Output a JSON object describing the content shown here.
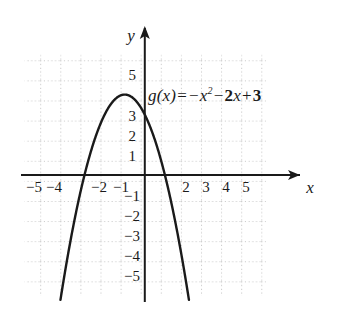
{
  "figure": {
    "background_color": "#ffffff",
    "ink_color": "#1a1a1a",
    "grid_color": "#c8c8c8"
  },
  "equation": {
    "function_name": "g(x)",
    "equals": "=",
    "term1_sign": "−",
    "term1_base": "x",
    "term1_exponent": "2",
    "term2_sign": "−",
    "term2_coefficient": "2",
    "term2_variable": "x",
    "term3_sign": "+",
    "term3_constant": "3",
    "full_text": "g(x) = −x² − 2x + 3"
  },
  "axes": {
    "x_axis_label": "x",
    "y_axis_label": "y",
    "x_tick_labels": [
      "−5",
      "−4",
      "−2",
      "−1",
      "2",
      "3",
      "4",
      "5"
    ],
    "y_tick_labels": [
      "5",
      "3",
      "2",
      "1",
      "−1",
      "−2",
      "−3",
      "−4",
      "−5"
    ]
  },
  "chart_data": {
    "type": "line",
    "xlabel": "x",
    "ylabel": "y",
    "xlim": [
      -6.15,
      5.9
    ],
    "ylim": [
      -6.1,
      6.0
    ],
    "grid": true,
    "grid_spacing": 1,
    "legend": "none",
    "annotations": [
      "g(x) = −x² − 2x + 3"
    ],
    "x_ticks": [
      -5,
      -4,
      -3,
      -2,
      -1,
      1,
      2,
      3,
      4,
      5
    ],
    "x_ticks_labeled": [
      -5,
      -4,
      -2,
      -1,
      2,
      3,
      4,
      5
    ],
    "y_ticks": [
      -5,
      -4,
      -3,
      -2,
      -1,
      1,
      2,
      3,
      4,
      5
    ],
    "y_ticks_labeled": [
      5,
      3,
      2,
      1,
      -1,
      -2,
      -3,
      -4,
      -5
    ],
    "series": [
      {
        "name": "g(x) = -x^2 - 2x + 3",
        "equation": "y = -x^2 - 2x + 3",
        "vertex": [
          -1,
          4
        ],
        "roots": [
          -3,
          1
        ],
        "y_intercept": 3,
        "opens": "down",
        "color": "#1a1a1a",
        "x": [
          -4.3,
          -4.0,
          -3.5,
          -3.0,
          -2.5,
          -2.0,
          -1.5,
          -1.0,
          -0.5,
          0.0,
          0.5,
          1.0,
          1.5,
          2.0,
          2.3
        ],
        "y": [
          -6.89,
          -5.0,
          -2.25,
          0.0,
          1.75,
          3.0,
          3.75,
          4.0,
          3.75,
          3.0,
          1.75,
          0.0,
          -2.25,
          -5.0,
          -6.89
        ]
      }
    ]
  }
}
